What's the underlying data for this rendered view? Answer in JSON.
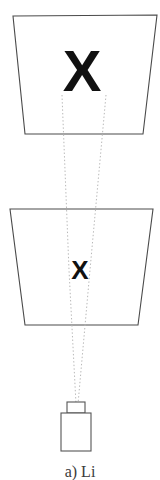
{
  "figure": {
    "background_color": "#ffffff",
    "outline_color": "#4a4a4a",
    "ray_color": "#b8b8b8",
    "marker_color": "#111111",
    "planes": [
      {
        "name": "far-image-plane",
        "marker": "X",
        "points": "13,16 157,15 143,134 25,134"
      },
      {
        "name": "near-image-plane",
        "marker": "X",
        "points": "10,209 153,209 138,325 25,325"
      }
    ],
    "rays": [
      {
        "name": "ray-left",
        "d": "M 62,95 L 69,270 L 76,404"
      },
      {
        "name": "ray-right",
        "d": "M 106,95 L 90,270 L 78,404"
      }
    ],
    "camera": {
      "name": "camera",
      "lens": {
        "x": 67,
        "y": 402,
        "width": 18,
        "height": 11
      },
      "body": {
        "x": 61,
        "y": 413,
        "width": 30,
        "height": 38
      }
    },
    "caption_fragment": "a) Li"
  }
}
